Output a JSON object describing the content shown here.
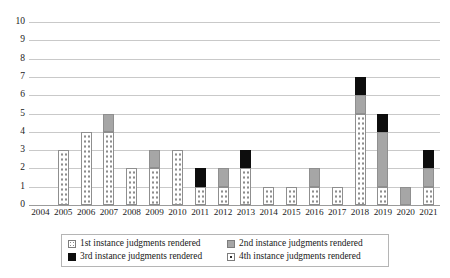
{
  "chart_data": {
    "type": "bar",
    "stacked": true,
    "title": "",
    "subtitle": "",
    "xlabel": "",
    "ylabel": "",
    "ylim": [
      0,
      10
    ],
    "y_ticks": [
      0,
      1,
      2,
      3,
      4,
      5,
      6,
      7,
      8,
      9,
      10
    ],
    "grid": true,
    "legend_position": "bottom",
    "categories": [
      "2004",
      "2005",
      "2006",
      "2007",
      "2008",
      "2009",
      "2010",
      "2011",
      "2012",
      "2013",
      "2014",
      "2015",
      "2016",
      "2017",
      "2018",
      "2019",
      "2020",
      "2021"
    ],
    "series": [
      {
        "name": "1st instance judgments rendered",
        "color": "#ffffff",
        "pattern": "small-dots",
        "values": [
          0,
          3,
          4,
          4,
          2,
          2,
          3,
          1,
          1,
          2,
          1,
          1,
          1,
          1,
          5,
          1,
          0,
          1
        ]
      },
      {
        "name": "2nd instance judgments rendered",
        "color": "#a6a6a6",
        "pattern": "solid-gray",
        "values": [
          0,
          0,
          0,
          1,
          0,
          1,
          0,
          0,
          1,
          0,
          0,
          0,
          1,
          0,
          1,
          3,
          1,
          1
        ]
      },
      {
        "name": "3rd instance judgments rendered",
        "color": "#0d0d0d",
        "pattern": "solid-black",
        "values": [
          0,
          0,
          0,
          0,
          0,
          0,
          0,
          1,
          0,
          1,
          0,
          0,
          0,
          0,
          1,
          1,
          0,
          1
        ]
      },
      {
        "name": "4th instance judgments rendered",
        "color": "#ffffff",
        "pattern": "large-dots",
        "values": [
          0,
          0,
          0,
          0,
          0,
          0,
          0,
          0,
          0,
          0,
          0,
          0,
          0,
          0,
          0,
          0,
          0,
          0
        ]
      }
    ],
    "totals": [
      0,
      3,
      4,
      5,
      2,
      3,
      3,
      2,
      2,
      3,
      1,
      1,
      2,
      1,
      7,
      5,
      1,
      3
    ]
  },
  "legend": {
    "items": [
      {
        "label": "1st instance judgments rendered",
        "swatch": "s1"
      },
      {
        "label": "2nd instance judgments rendered",
        "swatch": "s2"
      },
      {
        "label": "3rd instance judgments rendered",
        "swatch": "s3"
      },
      {
        "label": "4th instance judgments rendered",
        "swatch": "s4"
      }
    ]
  }
}
